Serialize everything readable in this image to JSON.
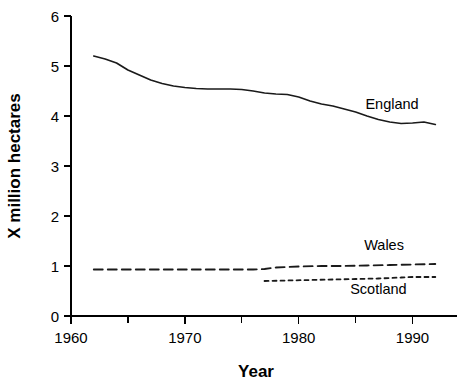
{
  "chart_data": {
    "type": "line",
    "title": "",
    "xlabel": "Year",
    "ylabel": "X million hectares",
    "xlim": [
      1960,
      1992.5
    ],
    "ylim": [
      0,
      6
    ],
    "grid": false,
    "legend_position": "inline-right",
    "x_ticks_labeled": [
      1960,
      1970,
      1980,
      1990
    ],
    "x_ticks_minor": [
      1965,
      1975,
      1985
    ],
    "y_ticks": [
      0,
      1,
      2,
      3,
      4,
      5,
      6
    ],
    "series": [
      {
        "name": "England",
        "style": "solid",
        "label_x": 1988.2,
        "label_y": 4.15,
        "x": [
          1962,
          1963,
          1964,
          1965,
          1966,
          1967,
          1968,
          1969,
          1970,
          1971,
          1972,
          1973,
          1974,
          1975,
          1976,
          1977,
          1978,
          1979,
          1980,
          1981,
          1982,
          1983,
          1984,
          1985,
          1986,
          1987,
          1988,
          1989,
          1990,
          1991,
          1992
        ],
        "y": [
          5.2,
          5.14,
          5.06,
          4.92,
          4.82,
          4.72,
          4.65,
          4.6,
          4.57,
          4.55,
          4.54,
          4.54,
          4.54,
          4.53,
          4.5,
          4.46,
          4.44,
          4.43,
          4.38,
          4.3,
          4.24,
          4.2,
          4.14,
          4.08,
          4.0,
          3.93,
          3.88,
          3.85,
          3.86,
          3.88,
          3.83
        ]
      },
      {
        "name": "Wales",
        "style": "dashed",
        "label_x": 1987.5,
        "label_y": 1.32,
        "x": [
          1962,
          1965,
          1968,
          1971,
          1974,
          1976,
          1977,
          1978,
          1979,
          1980,
          1982,
          1984,
          1986,
          1988,
          1990,
          1992
        ],
        "y": [
          0.93,
          0.93,
          0.93,
          0.93,
          0.93,
          0.93,
          0.94,
          0.97,
          0.98,
          0.99,
          1.0,
          1.0,
          1.01,
          1.02,
          1.03,
          1.04
        ]
      },
      {
        "name": "Scotland",
        "style": "dotted",
        "label_x": 1987.0,
        "label_y": 0.44,
        "x": [
          1977,
          1979,
          1981,
          1983,
          1985,
          1987,
          1989,
          1990,
          1991,
          1992
        ],
        "y": [
          0.7,
          0.71,
          0.72,
          0.73,
          0.74,
          0.75,
          0.77,
          0.78,
          0.78,
          0.78
        ]
      }
    ]
  }
}
